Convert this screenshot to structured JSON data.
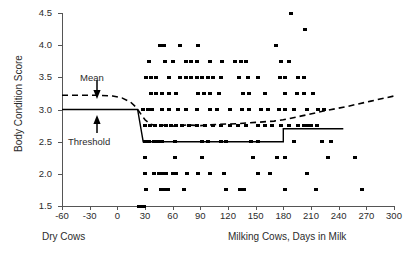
{
  "chart_data": {
    "type": "scatter",
    "title": "",
    "xlabel": "Milking Cows, Days in Milk",
    "xlabel_left": "Dry Cows",
    "ylabel": "Body Condition Score",
    "xlim": [
      -60,
      300
    ],
    "ylim": [
      1.5,
      4.5
    ],
    "xticks": [
      -60,
      -30,
      0,
      30,
      60,
      90,
      120,
      150,
      180,
      210,
      240,
      270,
      300
    ],
    "yticks": [
      1.5,
      2.0,
      2.5,
      3.0,
      3.5,
      4.0,
      4.5
    ],
    "xtick_labels": [
      "-60",
      "-30",
      "0",
      "30",
      "60",
      "90",
      "120",
      "150",
      "180",
      "210",
      "240",
      "270",
      "300"
    ],
    "ytick_labels": [
      "1.5",
      "2.0",
      "2.5",
      "3.0",
      "3.5",
      "4.0",
      "4.5"
    ],
    "grid": false,
    "legend": "none",
    "annotations": [
      {
        "name": "mean",
        "text": "Mean",
        "points_to_y": 3.22,
        "points_to_x": -22
      },
      {
        "name": "threshold",
        "text": "Threshold",
        "points_to_y": 3.0,
        "points_to_x": -28
      }
    ],
    "series": [
      {
        "name": "Mean",
        "type": "line",
        "style": "dashed",
        "color": "#000000",
        "x": [
          -60,
          -40,
          -20,
          -5,
          5,
          14,
          20,
          25,
          30,
          36,
          44,
          52,
          62,
          75,
          90,
          110,
          130,
          150,
          170,
          180,
          200,
          225,
          250,
          275,
          300
        ],
        "y": [
          3.22,
          3.22,
          3.22,
          3.21,
          3.18,
          3.12,
          3.04,
          2.94,
          2.84,
          2.77,
          2.74,
          2.76,
          2.74,
          2.76,
          2.75,
          2.77,
          2.78,
          2.8,
          2.82,
          2.84,
          2.9,
          2.98,
          3.05,
          3.13,
          3.21
        ]
      },
      {
        "name": "Threshold",
        "type": "step",
        "style": "solid",
        "color": "#000000",
        "x": [
          -60,
          22,
          22,
          28,
          28,
          180,
          180,
          245
        ],
        "y": [
          3.0,
          3.0,
          3.0,
          2.5,
          2.5,
          2.5,
          2.7,
          2.7
        ]
      },
      {
        "name": "Body condition score observations",
        "type": "scatter",
        "marker": "square",
        "color": "#000000",
        "points": [
          [
            23,
            1.5
          ],
          [
            25,
            1.5
          ],
          [
            27,
            1.5
          ],
          [
            29,
            1.5
          ],
          [
            31,
            1.75
          ],
          [
            47,
            1.75
          ],
          [
            51,
            1.75
          ],
          [
            55,
            1.75
          ],
          [
            72,
            1.75
          ],
          [
            118,
            1.75
          ],
          [
            133,
            1.75
          ],
          [
            137,
            1.75
          ],
          [
            182,
            1.75
          ],
          [
            215,
            1.75
          ],
          [
            265,
            1.75
          ],
          [
            30,
            2.0
          ],
          [
            40,
            2.0
          ],
          [
            45,
            2.0
          ],
          [
            49,
            2.0
          ],
          [
            53,
            2.0
          ],
          [
            60,
            2.0
          ],
          [
            64,
            2.0
          ],
          [
            75,
            2.0
          ],
          [
            88,
            2.0
          ],
          [
            100,
            2.0
          ],
          [
            116,
            2.0
          ],
          [
            152,
            2.0
          ],
          [
            166,
            2.0
          ],
          [
            206,
            2.0
          ],
          [
            30,
            2.25
          ],
          [
            62,
            2.25
          ],
          [
            92,
            2.25
          ],
          [
            147,
            2.25
          ],
          [
            173,
            2.25
          ],
          [
            182,
            2.25
          ],
          [
            228,
            2.25
          ],
          [
            258,
            2.25
          ],
          [
            30,
            2.5
          ],
          [
            34,
            2.5
          ],
          [
            40,
            2.5
          ],
          [
            44,
            2.5
          ],
          [
            48,
            2.5
          ],
          [
            63,
            2.5
          ],
          [
            92,
            2.5
          ],
          [
            98,
            2.5
          ],
          [
            112,
            2.5
          ],
          [
            118,
            2.5
          ],
          [
            145,
            2.5
          ],
          [
            152,
            2.5
          ],
          [
            192,
            2.5
          ],
          [
            222,
            2.5
          ],
          [
            232,
            2.5
          ],
          [
            30,
            2.75
          ],
          [
            35,
            2.75
          ],
          [
            41,
            2.75
          ],
          [
            47,
            2.75
          ],
          [
            53,
            2.75
          ],
          [
            58,
            2.75
          ],
          [
            64,
            2.75
          ],
          [
            70,
            2.75
          ],
          [
            78,
            2.75
          ],
          [
            86,
            2.75
          ],
          [
            95,
            2.75
          ],
          [
            104,
            2.75
          ],
          [
            112,
            2.75
          ],
          [
            122,
            2.75
          ],
          [
            131,
            2.75
          ],
          [
            140,
            2.75
          ],
          [
            152,
            2.75
          ],
          [
            160,
            2.75
          ],
          [
            168,
            2.75
          ],
          [
            178,
            2.75
          ],
          [
            186,
            2.75
          ],
          [
            196,
            2.75
          ],
          [
            202,
            2.75
          ],
          [
            206,
            2.75
          ],
          [
            210,
            2.75
          ],
          [
            216,
            2.75
          ],
          [
            28,
            3.0
          ],
          [
            33,
            3.0
          ],
          [
            38,
            3.0
          ],
          [
            48,
            3.0
          ],
          [
            56,
            3.0
          ],
          [
            66,
            3.0
          ],
          [
            74,
            3.0
          ],
          [
            86,
            3.0
          ],
          [
            100,
            3.0
          ],
          [
            108,
            3.0
          ],
          [
            122,
            3.0
          ],
          [
            135,
            3.0
          ],
          [
            143,
            3.0
          ],
          [
            156,
            3.0
          ],
          [
            163,
            3.0
          ],
          [
            175,
            3.0
          ],
          [
            182,
            3.0
          ],
          [
            192,
            3.0
          ],
          [
            206,
            3.0
          ],
          [
            218,
            3.0
          ],
          [
            224,
            3.0
          ],
          [
            36,
            3.25
          ],
          [
            42,
            3.25
          ],
          [
            48,
            3.25
          ],
          [
            56,
            3.25
          ],
          [
            64,
            3.25
          ],
          [
            88,
            3.25
          ],
          [
            94,
            3.25
          ],
          [
            100,
            3.25
          ],
          [
            110,
            3.25
          ],
          [
            136,
            3.25
          ],
          [
            143,
            3.25
          ],
          [
            160,
            3.25
          ],
          [
            182,
            3.25
          ],
          [
            195,
            3.25
          ],
          [
            202,
            3.25
          ],
          [
            212,
            3.25
          ],
          [
            31,
            3.5
          ],
          [
            36,
            3.5
          ],
          [
            42,
            3.5
          ],
          [
            56,
            3.5
          ],
          [
            68,
            3.5
          ],
          [
            74,
            3.5
          ],
          [
            80,
            3.5
          ],
          [
            86,
            3.5
          ],
          [
            92,
            3.5
          ],
          [
            98,
            3.5
          ],
          [
            104,
            3.5
          ],
          [
            112,
            3.5
          ],
          [
            132,
            3.5
          ],
          [
            142,
            3.5
          ],
          [
            152,
            3.5
          ],
          [
            176,
            3.5
          ],
          [
            182,
            3.5
          ],
          [
            196,
            3.5
          ],
          [
            202,
            3.5
          ],
          [
            34,
            3.75
          ],
          [
            52,
            3.75
          ],
          [
            60,
            3.75
          ],
          [
            74,
            3.75
          ],
          [
            80,
            3.75
          ],
          [
            86,
            3.75
          ],
          [
            100,
            3.75
          ],
          [
            114,
            3.75
          ],
          [
            128,
            3.75
          ],
          [
            134,
            3.75
          ],
          [
            140,
            3.75
          ],
          [
            178,
            3.75
          ],
          [
            186,
            3.75
          ],
          [
            46,
            4.0
          ],
          [
            51,
            4.0
          ],
          [
            68,
            4.0
          ],
          [
            88,
            4.0
          ],
          [
            172,
            4.0
          ],
          [
            204,
            4.25
          ],
          [
            188,
            4.5
          ]
        ]
      }
    ]
  },
  "figure": {
    "y_axis_title": "Body Condition Score",
    "x_axis_title_left": "Dry Cows",
    "x_axis_title_right": "Milking Cows, Days in Milk",
    "mean_annotation": "Mean",
    "threshold_annotation": "Threshold",
    "axis_color": "#555555",
    "marker_color": "#000000",
    "text_color": "#2b2b2b"
  }
}
